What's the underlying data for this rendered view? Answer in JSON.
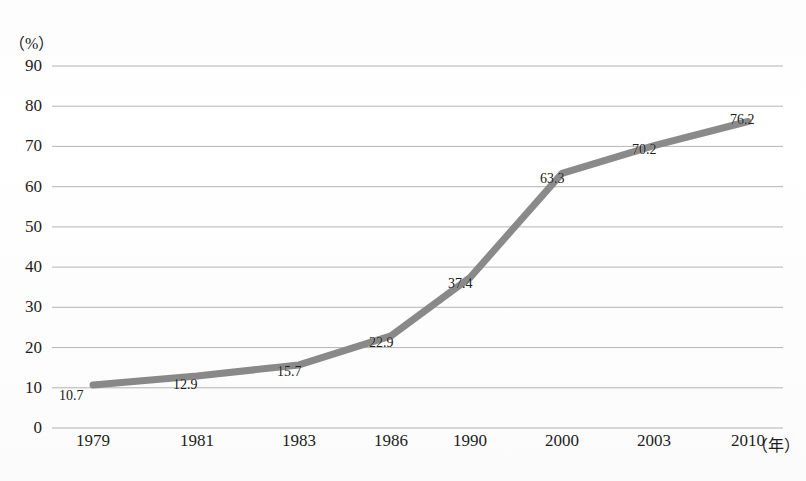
{
  "chart_data": {
    "type": "line",
    "title": "",
    "subtitle": "",
    "xlabel": "年",
    "ylabel": "%",
    "unit_y_text": "（%）",
    "unit_x_text": "（年）",
    "categories": [
      "1979",
      "1981",
      "1983",
      "1986",
      "1990",
      "2000",
      "2003",
      "2010"
    ],
    "values": [
      10.7,
      12.9,
      15.7,
      22.9,
      37.4,
      63.3,
      70.2,
      76.2
    ],
    "point_labels": [
      "10.7",
      "12.9",
      "15.7",
      "22.9",
      "37.4",
      "63.3",
      "70.2",
      "76.2"
    ],
    "ylim": [
      0,
      90
    ],
    "ytick_labels": [
      "90",
      "80",
      "70",
      "60",
      "50",
      "40",
      "30",
      "20",
      "10",
      "0"
    ],
    "ytick_values": [
      90,
      80,
      70,
      60,
      50,
      40,
      30,
      20,
      10,
      0
    ],
    "grid": true,
    "grid_axis": "y",
    "legend": null,
    "legend_position": "none",
    "series": [
      {
        "name": "",
        "values": [
          10.7,
          12.9,
          15.7,
          22.9,
          37.4,
          63.3,
          70.2,
          76.2
        ]
      }
    ],
    "colors": {
      "line": "#8a8a8a",
      "grid": "#9a9a9a",
      "axis": "#6e6e6e",
      "text": "#1d1d1d",
      "background": "#ffffff"
    },
    "line_width_px": 7
  }
}
